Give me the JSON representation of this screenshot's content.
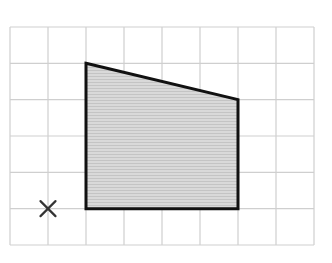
{
  "diagram": {
    "type": "grid-shape",
    "grid": {
      "columns": 8,
      "rows": 6,
      "line_color": "#cfcfcf",
      "origin_px": [
        10,
        27
      ],
      "cell_w": 38,
      "cell_h": 36.33
    },
    "shape": {
      "name": "trapezium",
      "vertices_grid": [
        [
          2,
          1
        ],
        [
          6,
          2
        ],
        [
          6,
          5
        ],
        [
          2,
          5
        ]
      ],
      "fill": "#d4d4d4",
      "stroke": "#111111"
    },
    "marker": {
      "symbol": "×",
      "position_grid": [
        1,
        5
      ],
      "color": "#333333"
    }
  }
}
